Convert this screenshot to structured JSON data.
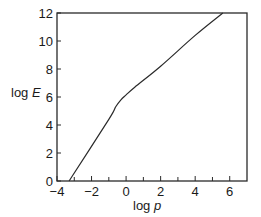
{
  "chart_data": {
    "type": "line",
    "title": "",
    "xlabel": "log p",
    "ylabel": "log E",
    "xlabel_parts": {
      "prefix": "log ",
      "var": "p"
    },
    "ylabel_parts": {
      "prefix": "log ",
      "var": "E"
    },
    "xlim": [
      -4,
      7
    ],
    "ylim": [
      0,
      12
    ],
    "x_ticks": [
      -4,
      -2,
      0,
      2,
      4,
      6
    ],
    "x_tick_labels": [
      "−4",
      "−2",
      "0",
      "2",
      "4",
      "6"
    ],
    "x_minor_ticks": [
      -3,
      -1,
      1,
      3,
      5
    ],
    "y_ticks": [
      0,
      2,
      4,
      6,
      8,
      10,
      12
    ],
    "y_tick_labels": [
      "0",
      "2",
      "4",
      "6",
      "8",
      "10",
      "12"
    ],
    "grid": false,
    "legend": null,
    "series": [
      {
        "name": "log E vs log p",
        "color": "#2a2a2a",
        "x": [
          -3.3,
          -1.0,
          -0.6,
          -0.3,
          0.0,
          0.5,
          2.0,
          4.0,
          5.6
        ],
        "y": [
          0.0,
          4.4,
          5.3,
          5.8,
          6.15,
          6.7,
          8.2,
          10.4,
          12.0
        ]
      }
    ]
  },
  "style": {
    "axis_color": "#2a2a2a",
    "line_color": "#2a2a2a",
    "background": "#ffffff"
  }
}
